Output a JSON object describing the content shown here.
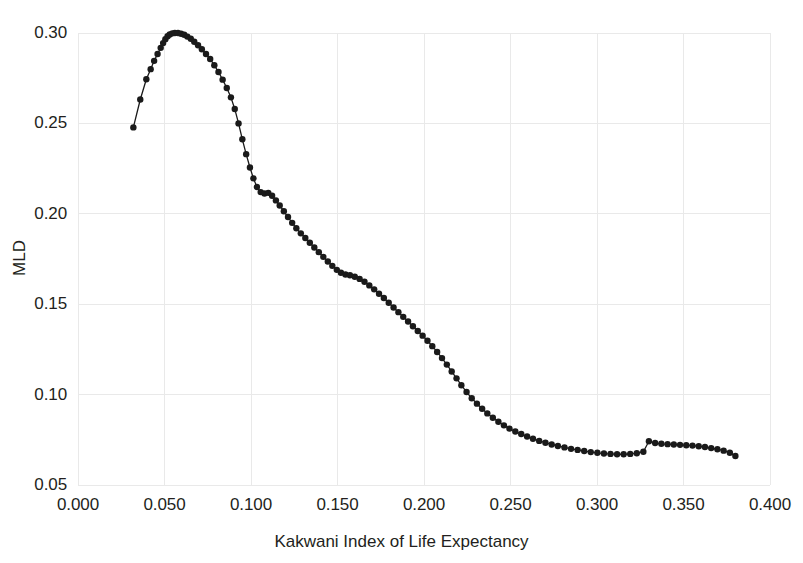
{
  "chart_data": {
    "type": "line",
    "title": "",
    "subtitle": "",
    "xlabel": "Kakwani Index of Life Expectancy",
    "ylabel": "MLD",
    "xlim": [
      0.0,
      0.4
    ],
    "ylim": [
      0.05,
      0.3
    ],
    "xticks": [
      0.0,
      0.05,
      0.1,
      0.15,
      0.2,
      0.25,
      0.3,
      0.35,
      0.4
    ],
    "xtick_labels": [
      "0.000",
      "0.050",
      "0.100",
      "0.150",
      "0.200",
      "0.250",
      "0.300",
      "0.350",
      "0.400"
    ],
    "yticks": [
      0.05,
      0.1,
      0.15,
      0.2,
      0.25,
      0.3
    ],
    "ytick_labels": [
      "0.05",
      "0.10",
      "0.15",
      "0.20",
      "0.25",
      "0.30"
    ],
    "grid": true,
    "legend": "none",
    "line_color": "#1a1a1a",
    "marker_color": "#1a1a1a",
    "marker": "circle",
    "marker_size": 3.2,
    "line_width": 1.3,
    "series": [
      {
        "name": "MLD vs Kakwani Index",
        "x": [
          0.032,
          0.036,
          0.0395,
          0.042,
          0.044,
          0.046,
          0.0478,
          0.0492,
          0.0505,
          0.0518,
          0.053,
          0.0545,
          0.056,
          0.0578,
          0.0596,
          0.0614,
          0.0632,
          0.0652,
          0.0672,
          0.0694,
          0.0716,
          0.074,
          0.0764,
          0.0788,
          0.0812,
          0.0836,
          0.086,
          0.0884,
          0.0906,
          0.0928,
          0.095,
          0.0972,
          0.0994,
          0.1014,
          0.1034,
          0.1056,
          0.1078,
          0.11,
          0.1122,
          0.1144,
          0.1166,
          0.119,
          0.1214,
          0.1238,
          0.1262,
          0.1288,
          0.1314,
          0.134,
          0.1366,
          0.1392,
          0.1418,
          0.1444,
          0.147,
          0.1496,
          0.152,
          0.1546,
          0.1572,
          0.16,
          0.1628,
          0.1656,
          0.1684,
          0.1712,
          0.174,
          0.1768,
          0.1796,
          0.1824,
          0.1852,
          0.188,
          0.1908,
          0.1936,
          0.1964,
          0.1992,
          0.202,
          0.2048,
          0.2076,
          0.2104,
          0.2132,
          0.216,
          0.2188,
          0.2216,
          0.2246,
          0.2276,
          0.2306,
          0.2336,
          0.2366,
          0.2398,
          0.243,
          0.2462,
          0.2494,
          0.2528,
          0.2562,
          0.2596,
          0.263,
          0.2666,
          0.2702,
          0.2738,
          0.2774,
          0.2812,
          0.285,
          0.2888,
          0.2926,
          0.2964,
          0.3002,
          0.304,
          0.3078,
          0.3116,
          0.3154,
          0.3192,
          0.323,
          0.3268,
          0.33,
          0.3336,
          0.3372,
          0.3408,
          0.3444,
          0.348,
          0.3516,
          0.3552,
          0.3588,
          0.3624,
          0.366,
          0.3696,
          0.3732,
          0.3768,
          0.38
        ],
        "y": [
          0.2478,
          0.2632,
          0.2744,
          0.28,
          0.2846,
          0.2884,
          0.2918,
          0.2944,
          0.2966,
          0.2982,
          0.2992,
          0.2998,
          0.3,
          0.3,
          0.2996,
          0.299,
          0.298,
          0.2968,
          0.2952,
          0.2932,
          0.291,
          0.2884,
          0.2856,
          0.2822,
          0.2784,
          0.2742,
          0.2696,
          0.2644,
          0.258,
          0.25,
          0.2412,
          0.233,
          0.2256,
          0.2196,
          0.2148,
          0.212,
          0.2112,
          0.2116,
          0.21,
          0.2074,
          0.2046,
          0.2014,
          0.1982,
          0.195,
          0.192,
          0.1892,
          0.1866,
          0.184,
          0.1814,
          0.1788,
          0.1762,
          0.1736,
          0.1712,
          0.169,
          0.1674,
          0.1664,
          0.166,
          0.1652,
          0.164,
          0.1624,
          0.1604,
          0.1582,
          0.1558,
          0.1534,
          0.1508,
          0.1482,
          0.1456,
          0.143,
          0.1404,
          0.1378,
          0.1352,
          0.1326,
          0.1298,
          0.1268,
          0.1236,
          0.1202,
          0.1166,
          0.1128,
          0.109,
          0.1052,
          0.1014,
          0.098,
          0.095,
          0.0922,
          0.0896,
          0.0872,
          0.085,
          0.083,
          0.0812,
          0.0796,
          0.0782,
          0.0768,
          0.0756,
          0.0744,
          0.0734,
          0.0724,
          0.0716,
          0.0708,
          0.07,
          0.0694,
          0.0688,
          0.0682,
          0.0678,
          0.0674,
          0.0672,
          0.067,
          0.067,
          0.0672,
          0.0676,
          0.0684,
          0.0742,
          0.0732,
          0.0728,
          0.0726,
          0.0724,
          0.0722,
          0.072,
          0.0718,
          0.0714,
          0.071,
          0.0704,
          0.0698,
          0.069,
          0.0678,
          0.066
        ]
      }
    ]
  }
}
